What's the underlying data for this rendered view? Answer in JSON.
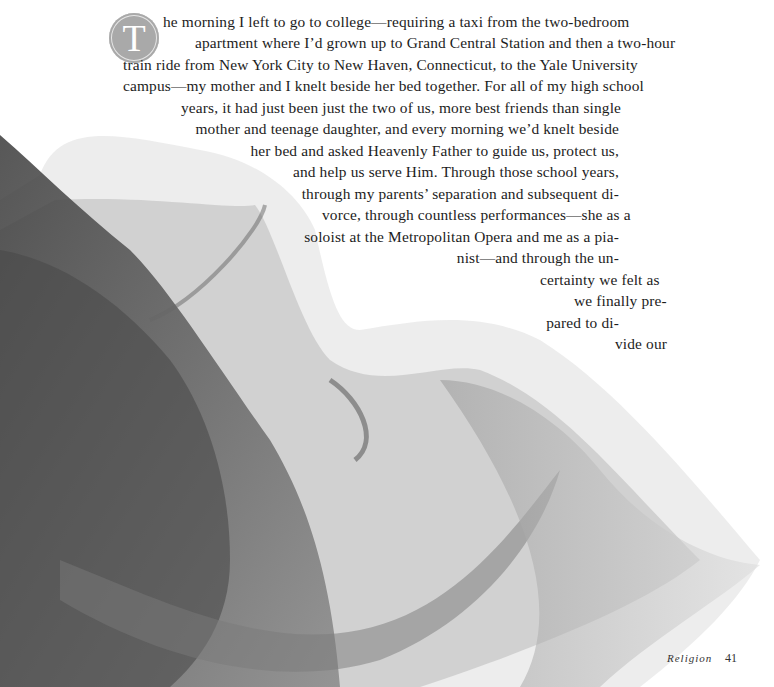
{
  "drop_cap": "T",
  "paragraph_lines": [
    "he morning I left to go to college—requiring a taxi from the two-bedroom",
    "apartment where I’d grown up to Grand Central Station and then a two-hour",
    "train ride from New York City to New Haven, Connecticut, to the Yale University",
    "campus—my mother and I knelt beside her bed together. For all of my high school",
    "years, it had just been just the two of us, more best friends than single",
    "mother and teenage daughter, and every morning we’d knelt beside",
    "her bed and asked Heavenly Father to guide us, protect us,",
    "and help us serve Him. Through those school years,",
    "through my parents’ separation and subsequent di-",
    "vorce, through countless performances—she as a",
    "soloist at the Metropolitan Opera and me as a pia-",
    "nist—and through the un-",
    "certainty we felt as",
    "we finally pre-",
    "pared to di-",
    "vide our"
  ],
  "footer": {
    "section": "Religion",
    "page_number": "41"
  },
  "colors": {
    "drop_cap_bg": "#a9a9a9",
    "text": "#1c1c1c",
    "fabric": "#5a5a5a"
  }
}
